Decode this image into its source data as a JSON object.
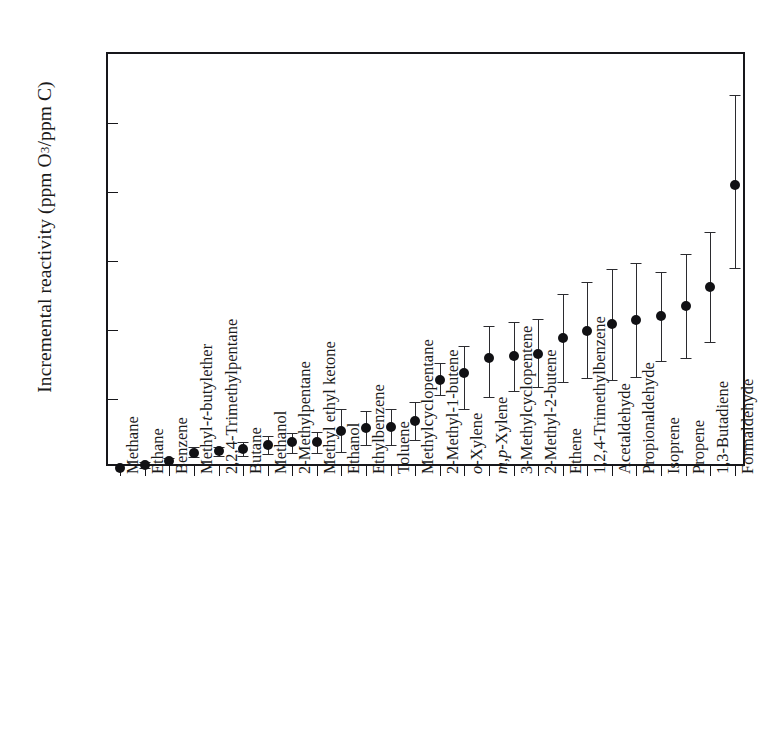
{
  "chart_data": {
    "type": "scatter",
    "title": "",
    "xlabel": "",
    "ylabel": "Incremental reactivity (ppm O3/ppm C)",
    "ylabel_parts": {
      "pre": "Incremental reactivity (ppm O",
      "sub": "3",
      "post": "/ppm C)"
    },
    "ylim": [
      0.0,
      6.0
    ],
    "ytick_labels": [
      "0.0",
      "1.0",
      "2.0",
      "3.0",
      "4.0",
      "5.0",
      "6.0"
    ],
    "ytick_values": [
      0.0,
      1.0,
      2.0,
      3.0,
      4.0,
      5.0,
      6.0
    ],
    "grid": false,
    "legend": null,
    "error_bars": "asymmetric",
    "categories": [
      "Methane",
      "Ethane",
      "Benzene",
      "Methyl-t-butylether",
      "2,2,4-Trimethylpentane",
      "Butane",
      "Methanol",
      "2-Methylpentane",
      "Methyl ethyl ketone",
      "Ethanol",
      "Ethylbenzene",
      "Toluene",
      "Methylcyclopentane",
      "2-Methyl-1-butene",
      "o-Xylene",
      "m,p-Xylene",
      "3-Methylcyclopentene",
      "2-Methyl-2-butene",
      "Ethene",
      "1,2,4-Trimethylbenzene",
      "Acetaldehyde",
      "Propionaldehyde",
      "Isoprene",
      "Propene",
      "1,3-Butadiene",
      "Formaldehyde"
    ],
    "category_italic_prefix": {
      "3": "t",
      "14": "o",
      "15": "m,p"
    },
    "values": [
      0.0,
      0.04,
      0.1,
      0.22,
      0.24,
      0.27,
      0.33,
      0.37,
      0.38,
      0.53,
      0.58,
      0.59,
      0.68,
      1.28,
      1.37,
      1.59,
      1.63,
      1.65,
      1.88,
      1.99,
      2.08,
      2.15,
      2.2,
      2.35,
      2.62,
      4.1
    ],
    "err_low": [
      0.0,
      0.0,
      0.06,
      0.16,
      0.18,
      0.17,
      0.2,
      0.22,
      0.22,
      0.23,
      0.33,
      0.34,
      0.41,
      1.06,
      0.85,
      1.03,
      1.12,
      1.17,
      1.24,
      1.3,
      1.28,
      1.32,
      1.55,
      1.6,
      1.82,
      2.9
    ],
    "err_high": [
      0.0,
      0.08,
      0.14,
      0.3,
      0.31,
      0.37,
      0.46,
      0.51,
      0.52,
      0.85,
      0.83,
      0.85,
      0.96,
      1.52,
      1.77,
      2.06,
      2.12,
      2.16,
      2.52,
      2.69,
      2.88,
      2.97,
      2.84,
      3.1,
      3.42,
      5.4
    ]
  }
}
